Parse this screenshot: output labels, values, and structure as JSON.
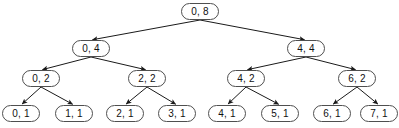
{
  "diagram": {
    "type": "binary-tree",
    "node_shape": "stadium",
    "edge_style": "arrow",
    "colors": {
      "background": "#ffffff",
      "node_fill": "#ffffff",
      "node_border": "#4f4f4f",
      "edge": "#1a1a1a",
      "text": "#111111"
    },
    "levels": [
      {
        "depth": 0,
        "nodes": [
          {
            "id": "n0",
            "label": "0, 8",
            "start": 0,
            "length": 8,
            "x": 181,
            "y": 3
          }
        ]
      },
      {
        "depth": 1,
        "nodes": [
          {
            "id": "n1",
            "label": "0, 4",
            "start": 0,
            "length": 4,
            "x": 72,
            "y": 40
          },
          {
            "id": "n2",
            "label": "4, 4",
            "start": 4,
            "length": 4,
            "x": 287,
            "y": 40
          }
        ]
      },
      {
        "depth": 2,
        "nodes": [
          {
            "id": "n3",
            "label": "0, 2",
            "start": 0,
            "length": 2,
            "x": 22,
            "y": 70
          },
          {
            "id": "n4",
            "label": "2, 2",
            "start": 2,
            "length": 2,
            "x": 128,
            "y": 70
          },
          {
            "id": "n5",
            "label": "4, 2",
            "start": 4,
            "length": 2,
            "x": 227,
            "y": 70
          },
          {
            "id": "n6",
            "label": "6, 2",
            "start": 6,
            "length": 2,
            "x": 338,
            "y": 70
          }
        ]
      },
      {
        "depth": 3,
        "nodes": [
          {
            "id": "n7",
            "label": "0, 1",
            "start": 0,
            "length": 1,
            "x": 2,
            "y": 105
          },
          {
            "id": "n8",
            "label": "1, 1",
            "start": 1,
            "length": 1,
            "x": 55,
            "y": 105
          },
          {
            "id": "n9",
            "label": "2, 1",
            "start": 2,
            "length": 1,
            "x": 106,
            "y": 105
          },
          {
            "id": "n10",
            "label": "3, 1",
            "start": 3,
            "length": 1,
            "x": 158,
            "y": 105
          },
          {
            "id": "n11",
            "label": "4, 1",
            "start": 4,
            "length": 1,
            "x": 208,
            "y": 105
          },
          {
            "id": "n12",
            "label": "5, 1",
            "start": 5,
            "length": 1,
            "x": 261,
            "y": 105
          },
          {
            "id": "n13",
            "label": "6, 1",
            "start": 6,
            "length": 1,
            "x": 313,
            "y": 105
          },
          {
            "id": "n14",
            "label": "7, 1",
            "start": 7,
            "length": 1,
            "x": 360,
            "y": 105
          }
        ]
      }
    ],
    "edges": [
      {
        "from": "n0",
        "to": "n1"
      },
      {
        "from": "n0",
        "to": "n2"
      },
      {
        "from": "n1",
        "to": "n3"
      },
      {
        "from": "n1",
        "to": "n4"
      },
      {
        "from": "n2",
        "to": "n5"
      },
      {
        "from": "n2",
        "to": "n6"
      },
      {
        "from": "n3",
        "to": "n7"
      },
      {
        "from": "n3",
        "to": "n8"
      },
      {
        "from": "n4",
        "to": "n9"
      },
      {
        "from": "n4",
        "to": "n10"
      },
      {
        "from": "n5",
        "to": "n11"
      },
      {
        "from": "n5",
        "to": "n12"
      },
      {
        "from": "n6",
        "to": "n13"
      },
      {
        "from": "n6",
        "to": "n14"
      }
    ]
  }
}
